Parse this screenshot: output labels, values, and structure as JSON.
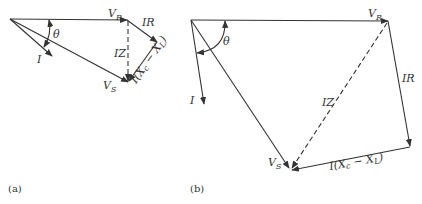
{
  "figure": {
    "panels": [
      {
        "caption": "(a)",
        "labels": {
          "vr": "V",
          "vr_sub": "R",
          "ir": "IR",
          "iz": "IZ",
          "vs": "V",
          "vs_sub": "S",
          "i": "I",
          "theta": "θ",
          "ixcxl": "I(X",
          "ixcxl_c": "c",
          "ixcxl_mid": " − X",
          "ixcxl_l": "L",
          "ixcxl_end": ")"
        }
      },
      {
        "caption": "(b)",
        "labels": {
          "vr": "V",
          "vr_sub": "R",
          "ir": "IR",
          "iz": "IZ",
          "vs": "V",
          "vs_sub": "S",
          "i": "I",
          "theta": "θ",
          "ixcxl": "I(X",
          "ixcxl_c": "c",
          "ixcxl_mid": " − X",
          "ixcxl_l": "L",
          "ixcxl_end": ")"
        }
      }
    ]
  }
}
